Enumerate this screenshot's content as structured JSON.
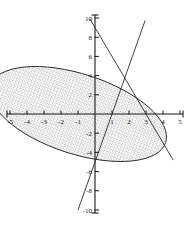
{
  "chart_data": {
    "type": "line",
    "title": "",
    "xlabel": "",
    "ylabel": "",
    "xlim": [
      -5,
      5
    ],
    "ylim": [
      -10,
      10
    ],
    "grid": false,
    "legend": "none",
    "xticks": [
      -5,
      -4,
      -3,
      -2,
      -1,
      1,
      2,
      3,
      4,
      5
    ],
    "yticks": [
      -10,
      -8,
      -6,
      -4,
      -2,
      2,
      4,
      6,
      8,
      10
    ],
    "xtick_labels": [
      "-5",
      "-4",
      "-3",
      "-2",
      "-1",
      "1",
      "2",
      "3",
      "4",
      "5"
    ],
    "ytick_labels": [
      "-10",
      "-8",
      "-6",
      "-4",
      "-2",
      "2",
      "4",
      "6",
      "8",
      "10"
    ],
    "annotations": [],
    "series": [
      {
        "name": "shaded-ellipse-region",
        "kind": "area",
        "fill": "stippled",
        "fill_color": "#efefef",
        "stroke": "#2b2b2b",
        "description": "Tilted shaded ellipse, major axis from lower-left to upper-right",
        "center": [
          -1.0,
          0.0
        ],
        "semi_major": 9.6,
        "semi_minor": 2.35,
        "rotation_deg": -72,
        "x_intercepts": [
          -3.0,
          1.0
        ],
        "y_intercepts": [
          9.0,
          -5.0
        ],
        "extreme_top": [
          0.05,
          9.0
        ],
        "extreme_bottom": [
          -1.2,
          -9.1
        ]
      },
      {
        "name": "ascending-line",
        "kind": "line",
        "stroke": "#2b2b2b",
        "slope": 5.0,
        "intercept": -5.0,
        "equation": "y = 5x - 5",
        "x_intercept": 1.0,
        "y_intercept": -5.0,
        "points": [
          [
            -1.0,
            -10.0
          ],
          [
            1.0,
            0.0
          ],
          [
            2.0,
            5.0
          ],
          [
            2.95,
            9.75
          ]
        ]
      },
      {
        "name": "descending-line",
        "kind": "line",
        "stroke": "#2b2b2b",
        "slope": -3.0,
        "intercept": 9.0,
        "equation": "y = -3x + 9",
        "x_intercept": 3.0,
        "y_intercept": 9.0,
        "points": [
          [
            -0.3,
            9.9
          ],
          [
            1.0,
            6.0
          ],
          [
            3.0,
            0.0
          ],
          [
            4.6,
            -4.8
          ]
        ]
      }
    ],
    "intersections": [
      {
        "of": [
          "ascending-line",
          "descending-line"
        ],
        "at": [
          1.75,
          3.75
        ]
      }
    ]
  },
  "axes": {
    "x_axis_name": "x-axis",
    "y_axis_name": "y-axis"
  }
}
